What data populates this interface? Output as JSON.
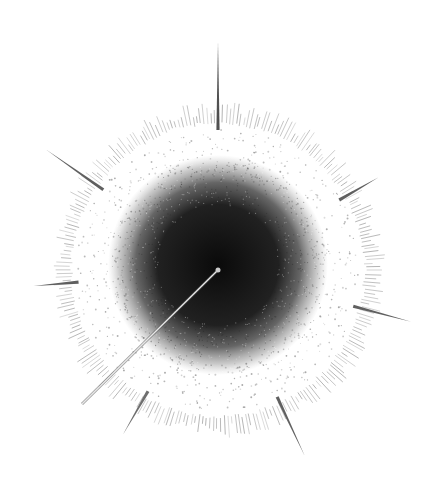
{
  "canvas": {
    "width": 439,
    "height": 495,
    "background": "#ffffff"
  },
  "graph": {
    "type": "radial-network",
    "center": {
      "x": 218,
      "y": 270
    },
    "core": {
      "radius": 90,
      "color": "#111111"
    },
    "halo": {
      "inner_radius": 95,
      "outer_radius": 142,
      "dot_color": "#777777"
    },
    "fringe": {
      "inner_radius": 145,
      "outer_radius": 168,
      "tick_count": 260,
      "color": "#555555"
    },
    "hub_node": {
      "x": 218,
      "y": 270,
      "radius": 2.5,
      "color": "#cccccc"
    },
    "long_edge": {
      "x1": 218,
      "y1": 270,
      "x2": 82,
      "y2": 404,
      "color": "#e8e8e8",
      "outline": "#555555"
    },
    "spikes": [
      {
        "angle_deg": -90,
        "from": 140,
        "to": 228,
        "color": "#333333"
      },
      {
        "angle_deg": -145,
        "from": 140,
        "to": 210,
        "color": "#444444"
      },
      {
        "angle_deg": -30,
        "from": 140,
        "to": 185,
        "color": "#444444"
      },
      {
        "angle_deg": 15,
        "from": 140,
        "to": 200,
        "color": "#444444"
      },
      {
        "angle_deg": 175,
        "from": 140,
        "to": 185,
        "color": "#444444"
      },
      {
        "angle_deg": 65,
        "from": 140,
        "to": 205,
        "color": "#444444"
      },
      {
        "angle_deg": 120,
        "from": 140,
        "to": 190,
        "color": "#555555"
      }
    ]
  }
}
